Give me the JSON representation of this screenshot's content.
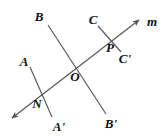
{
  "figure": {
    "type": "geometry-diagram",
    "background_color": "#ffffff",
    "stroke_color": "#555555",
    "label_color": "#111111",
    "canvas": {
      "width": 165,
      "height": 138
    },
    "lines": [
      {
        "name": "transversal-m",
        "label": "m",
        "from": {
          "x": 12,
          "y": 118
        },
        "to": {
          "x": 139,
          "y": 20
        },
        "arrow_start": true,
        "arrow_end": true
      },
      {
        "name": "segment-AA-prime",
        "label_start": "A",
        "label_end": "A'",
        "from": {
          "x": 30,
          "y": 67
        },
        "to": {
          "x": 52,
          "y": 117
        },
        "arrow_start": false,
        "arrow_end": false
      },
      {
        "name": "segment-BB-prime",
        "label_start": "B",
        "label_end": "B'",
        "from": {
          "x": 48,
          "y": 25
        },
        "to": {
          "x": 106,
          "y": 114
        },
        "arrow_start": false,
        "arrow_end": false
      },
      {
        "name": "segment-CC-prime",
        "label_start": "C",
        "label_end": "C'",
        "from": {
          "x": 98,
          "y": 26
        },
        "to": {
          "x": 121,
          "y": 52
        },
        "arrow_start": false,
        "arrow_end": false
      }
    ],
    "labels": {
      "B": "B",
      "C": "C",
      "m": "m",
      "A": "A",
      "P": "P",
      "C_prime": "C'",
      "O": "O",
      "N": "N",
      "A_prime": "A'",
      "B_prime": "B'"
    },
    "label_positions": {
      "B": {
        "x": 39,
        "y": 16
      },
      "C": {
        "x": 93,
        "y": 19
      },
      "m": {
        "x": 152,
        "y": 21
      },
      "A": {
        "x": 24,
        "y": 61
      },
      "P": {
        "x": 110,
        "y": 47
      },
      "C_prime": {
        "x": 125,
        "y": 58
      },
      "O": {
        "x": 75,
        "y": 76
      },
      "N": {
        "x": 37,
        "y": 103
      },
      "A_prime": {
        "x": 59,
        "y": 126
      },
      "B_prime": {
        "x": 111,
        "y": 123
      }
    },
    "intersections": [
      {
        "name": "N",
        "x": 40,
        "y": 95
      },
      {
        "name": "O",
        "x": 72,
        "y": 68
      },
      {
        "name": "P",
        "x": 110,
        "y": 38
      }
    ]
  }
}
